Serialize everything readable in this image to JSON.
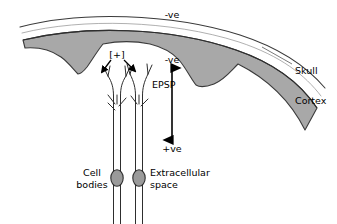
{
  "figure": {
    "background_color": "#ffffff",
    "stroke_color": "#1a1a1a",
    "cortex_fill": "#a8a8a8",
    "cell_body_fill": "#9a9a9a",
    "width": 337,
    "height": 224
  },
  "labels": {
    "scalp_negative": "-ve",
    "dipole_negative": "-ve",
    "dipole_positive": "+ve",
    "excitation": "[+]",
    "epsp": "EPSP",
    "skull": "Skull",
    "cortex": "Cortex",
    "cell_bodies_line1": "Cell",
    "cell_bodies_line2": "bodies",
    "extracellular_line1": "Extracellular",
    "extracellular_line2": "space"
  },
  "icons": {
    "dipole_arrow": "double-headed-vertical-arrow",
    "excitation_arrow_left": "arrow-down-left",
    "excitation_arrow_right": "arrow-down-right",
    "skull_arc": "thin-outer-arc",
    "cortex_band": "gray-gyri-band",
    "neuron_left": "pyramidal-neuron",
    "neuron_right": "pyramidal-neuron"
  },
  "geometry": {
    "skull_arc_path": "M 20,27 C 80,11 170,13 240,35 C 283,49 308,68 325,88",
    "cortex_outer_path": "M 22,41 C 82,26 168,28 236,51 C 276,65 300,84 316,108",
    "cortex_band_path": "M 22,41 C 82,26 168,28 236,51 C 276,65 300,84 316,108 L 306,128 C 292,100 272,80 240,65 C 228,86 214,87 196,85 C 178,83 160,61 151,51 C 128,46 108,46 94,49 C 88,62 82,71 78,73 C 71,69 62,60 52,54 C 42,50 32,49 25,50 Z",
    "dipole_arrow_x": 172,
    "dipole_arrow_top_y": 67,
    "dipole_arrow_bottom_y": 141,
    "neuron_left_x": 117,
    "neuron_right_x": 139,
    "cell_body_left": {
      "cx": 117,
      "cy": 178,
      "rx": 6,
      "ry": 8
    },
    "cell_body_right": {
      "cx": 139,
      "cy": 178,
      "rx": 6,
      "ry": 8
    }
  },
  "label_positions": {
    "scalp_negative": {
      "x": 172,
      "y": 15
    },
    "dipole_negative": {
      "x": 172,
      "y": 60
    },
    "dipole_positive": {
      "x": 172,
      "y": 149
    },
    "excitation": {
      "x": 117,
      "y": 55
    },
    "epsp": {
      "x": 152,
      "y": 85
    },
    "skull": {
      "x": 297,
      "y": 71
    },
    "cortex": {
      "x": 297,
      "y": 101
    },
    "cell_bodies_line1": {
      "x": 92,
      "y": 173
    },
    "cell_bodies_line2": {
      "x": 92,
      "y": 185
    },
    "extracellular_line1": {
      "x": 150,
      "y": 173
    },
    "extracellular_line2": {
      "x": 150,
      "y": 185
    }
  }
}
